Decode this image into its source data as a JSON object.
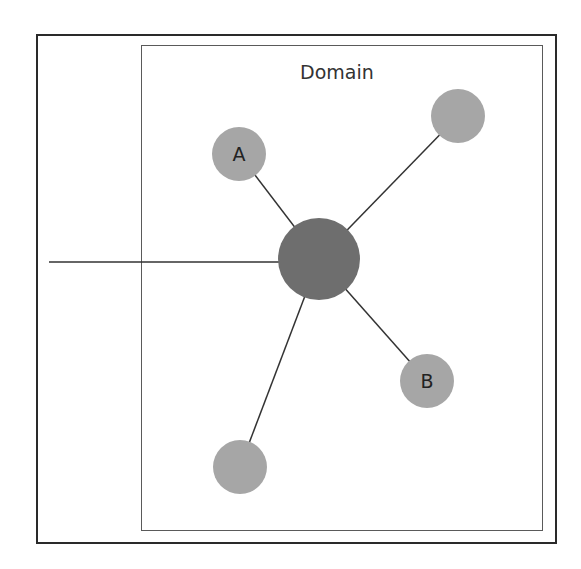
{
  "diagram": {
    "type": "network-star",
    "domain_label": "Domain",
    "colors": {
      "outer_frame": "#2a2a2a",
      "domain_box": "#5a5a5a",
      "center_node": "#6e6e6e",
      "peripheral_node": "#a6a6a6",
      "link": "#333333"
    },
    "center_node": {
      "id": "center",
      "label": "",
      "cx": 319,
      "cy": 259,
      "r": 41
    },
    "nodes": [
      {
        "id": "A",
        "label": "A",
        "cx": 239,
        "cy": 154,
        "r": 27
      },
      {
        "id": "top-right",
        "label": "",
        "cx": 458,
        "cy": 116,
        "r": 27
      },
      {
        "id": "B",
        "label": "B",
        "cx": 427,
        "cy": 381,
        "r": 27
      },
      {
        "id": "bottom-left",
        "label": "",
        "cx": 240,
        "cy": 467,
        "r": 27
      }
    ],
    "external_link": {
      "from_x": 49,
      "y": 262,
      "to": "center",
      "crosses": "domain-boundary"
    }
  }
}
